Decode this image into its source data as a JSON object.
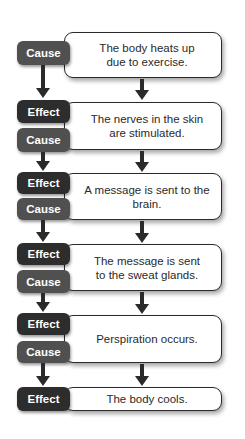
{
  "diagram": {
    "type": "cause-effect chain",
    "labels": {
      "cause": "Cause",
      "effect": "Effect"
    },
    "colors": {
      "effect_badge": "#2d2d2d",
      "cause_badge": "#505050",
      "box_border": "#2a2a2a",
      "arrow": "#2a2a2a"
    },
    "steps": [
      {
        "text": "The body heats up due to exercise.",
        "line1": "The body heats up",
        "line2": "due to exercise.",
        "badges": [
          "Cause"
        ]
      },
      {
        "text": "The nerves in the skin are stimulated.",
        "line1": "The nerves in the skin",
        "line2": "are stimulated.",
        "badges": [
          "Effect",
          "Cause"
        ]
      },
      {
        "text": "A message is sent to the brain.",
        "line1": "A message is sent to the brain.",
        "line2": "",
        "badges": [
          "Effect",
          "Cause"
        ]
      },
      {
        "text": "The message is sent to the sweat glands.",
        "line1": "The message is sent",
        "line2": "to the sweat glands.",
        "badges": [
          "Effect",
          "Cause"
        ]
      },
      {
        "text": "Perspiration occurs.",
        "line1": "Perspiration occurs.",
        "line2": "",
        "badges": [
          "Effect",
          "Cause"
        ]
      },
      {
        "text": "The body cools.",
        "line1": "The body cools.",
        "line2": "",
        "badges": [
          "Effect"
        ]
      }
    ]
  }
}
